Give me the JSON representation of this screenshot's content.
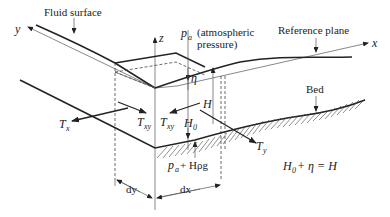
{
  "labels": {
    "fluid_surface": "Fluid surface",
    "reference_plane": "Reference plane",
    "bed": "Bed",
    "pa": "p",
    "pa_sub": "a",
    "pa_desc_line1": "(atmospheric",
    "pa_desc_line2": "pressure)",
    "eta": "η",
    "H": "H",
    "H0": "H",
    "H0_sub": "0",
    "Tx": "T",
    "Tx_sub": "x",
    "Txy_left": "T",
    "Txy_left_sub": "xy",
    "Txy_right": "T",
    "Txy_right_sub": "xy",
    "Ty": "T",
    "Ty_sub": "y",
    "bottom_pressure_p": "p",
    "bottom_pressure_sub": "a",
    "bottom_pressure_rest": " + Hρg",
    "dy": "dy",
    "dx": "dx",
    "equation": {
      "H0": "H",
      "H0_sub": "0",
      "rest": " + η = H"
    }
  },
  "axes": {
    "x": "x",
    "y": "y",
    "z": "z"
  }
}
